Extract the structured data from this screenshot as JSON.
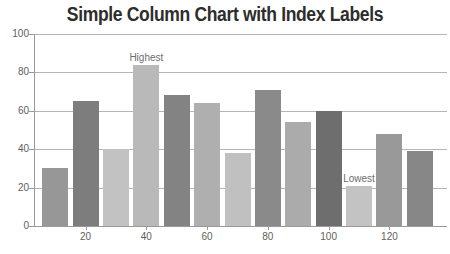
{
  "title": "Simple Column Chart with Index Labels",
  "colors": {
    "background": "#ffffff",
    "title": "#2d2d2d",
    "grid": "#b5b5b5",
    "axis_line": "#9a9a9a",
    "axis_label": "#5e5e5e",
    "index_label": "#6e6e6e"
  },
  "chart_data": {
    "type": "bar",
    "title": "Simple Column Chart with Index Labels",
    "x": [
      10,
      20,
      30,
      40,
      50,
      60,
      70,
      80,
      90,
      100,
      110,
      120,
      130
    ],
    "values": [
      30,
      65,
      40,
      84,
      68,
      64,
      38,
      71,
      54,
      60,
      21,
      48,
      39
    ],
    "bar_colors": [
      "#979797",
      "#7d7d7d",
      "#c2c2c2",
      "#b9b9b9",
      "#838383",
      "#afafaf",
      "#c0c0c0",
      "#8a8a8a",
      "#ababab",
      "#6e6e6e",
      "#c3c3c3",
      "#999999",
      "#878787"
    ],
    "index_labels": [
      {
        "bar_index": 3,
        "text": "Highest"
      },
      {
        "bar_index": 10,
        "text": "Lowest"
      }
    ],
    "xlabel": "",
    "ylabel": "",
    "ylim": [
      0,
      100
    ],
    "y_ticks": [
      0,
      20,
      40,
      60,
      80,
      100
    ],
    "x_tick_labels": [
      "20",
      "40",
      "60",
      "80",
      "100",
      "120"
    ],
    "labeled_bar_indices": [
      1,
      3,
      5,
      7,
      9,
      11
    ],
    "grid": "horizontal",
    "legend": "none"
  }
}
